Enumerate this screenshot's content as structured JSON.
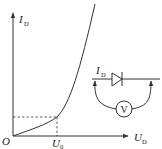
{
  "figure": {
    "type": "diode I-V characteristic with measurement circuit",
    "axes": {
      "y_label": "I",
      "y_label_sub": "D",
      "x_label": "U",
      "x_label_sub": "D",
      "origin_label": "O"
    },
    "markers": {
      "threshold_label": "U",
      "threshold_sub": "0"
    },
    "circuit": {
      "current_label": "I",
      "current_sub": "D",
      "meter_label": "V"
    },
    "colors": {
      "stroke": "#333333",
      "text": "#222222",
      "background": "#ffffff"
    }
  }
}
